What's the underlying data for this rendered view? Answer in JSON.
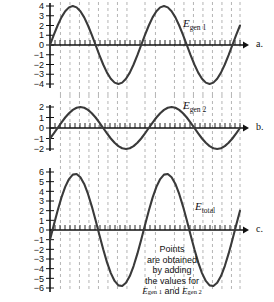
{
  "figure": {
    "part_labels": [
      "a.",
      "b.",
      "c."
    ],
    "caption_lines": [
      "Points",
      "are obtained",
      "by adding",
      "the values for"
    ],
    "caption_last_prefix": "E",
    "caption_last_sub1": "gen 1",
    "caption_last_mid": " and ",
    "caption_last_sub2": "gen 2",
    "colors": {
      "curve": "#3a3a3a",
      "axis": "#111111",
      "dashed": "#b4b4b4",
      "text": "#111111",
      "background": "#ffffff"
    }
  },
  "chart_data": [
    {
      "id": "egen1",
      "type": "line",
      "title": "",
      "label": "E_gen 1",
      "label_main": "E",
      "label_sub": "gen 1",
      "part": "a.",
      "xlabel": "",
      "ylabel": "",
      "ylim": [
        -4,
        4
      ],
      "yticks": [
        4,
        3,
        2,
        1,
        0,
        -1,
        -2,
        -3,
        -4
      ],
      "ytick_labels": [
        "4",
        "3",
        "2",
        "1",
        "0",
        "−1",
        "−2",
        "−3",
        "−4"
      ],
      "grid": false,
      "amplitude": 4,
      "periods": 2,
      "phase_deg": 0,
      "waveform": "sine",
      "x": [
        0,
        15,
        30,
        45,
        60,
        75,
        90,
        105,
        120,
        135,
        150,
        165,
        180,
        195,
        210,
        225,
        240,
        255,
        270,
        285,
        300,
        315,
        330,
        345,
        360,
        375,
        390,
        405,
        420,
        435,
        450,
        465,
        480,
        495,
        510,
        525,
        540,
        555,
        570,
        585,
        600,
        615,
        630,
        645,
        660,
        675,
        690,
        705,
        720,
        735,
        750
      ],
      "values": [
        0,
        1.04,
        2,
        2.83,
        3.46,
        3.86,
        4,
        3.86,
        3.46,
        2.83,
        2,
        1.04,
        0,
        -1.04,
        -2,
        -2.83,
        -3.46,
        -3.86,
        -4,
        -3.86,
        -3.46,
        -2.83,
        -2,
        -1.04,
        0,
        1.04,
        2,
        2.83,
        3.46,
        3.86,
        4,
        3.86,
        3.46,
        2.83,
        2,
        1.04,
        0,
        -1.04,
        -2,
        -2.83,
        -3.46,
        -3.86,
        -4,
        -3.86,
        -3.46,
        -2.83,
        -2,
        -1.04,
        0,
        1.04,
        2
      ]
    },
    {
      "id": "egen2",
      "type": "line",
      "title": "",
      "label": "E_gen 2",
      "label_main": "E",
      "label_sub": "gen 2",
      "part": "b.",
      "xlabel": "",
      "ylabel": "",
      "ylim": [
        -2,
        2
      ],
      "yticks": [
        2,
        1,
        0,
        -1,
        -2
      ],
      "ytick_labels": [
        "2",
        "1",
        "0",
        "−1",
        "−2"
      ],
      "grid": false,
      "amplitude": 2,
      "periods": 2,
      "phase_deg": -30,
      "waveform": "sine",
      "x": [
        0,
        15,
        30,
        45,
        60,
        75,
        90,
        105,
        120,
        135,
        150,
        165,
        180,
        195,
        210,
        225,
        240,
        255,
        270,
        285,
        300,
        315,
        330,
        345,
        360,
        375,
        390,
        405,
        420,
        435,
        450,
        465,
        480,
        495,
        510,
        525,
        540,
        555,
        570,
        585,
        600,
        615,
        630,
        645,
        660,
        675,
        690,
        705,
        720,
        735,
        750
      ],
      "values": [
        -1.0,
        -0.52,
        0,
        0.52,
        1.0,
        1.41,
        1.73,
        1.93,
        2.0,
        1.93,
        1.73,
        1.41,
        1.0,
        0.52,
        0,
        -0.52,
        -1.0,
        -1.41,
        -1.73,
        -1.93,
        -2.0,
        -1.93,
        -1.73,
        -1.41,
        -1.0,
        -0.52,
        0,
        0.52,
        1.0,
        1.41,
        1.73,
        1.93,
        2.0,
        1.93,
        1.73,
        1.41,
        1.0,
        0.52,
        0,
        -0.52,
        -1.0,
        -1.41,
        -1.73,
        -1.93,
        -2.0,
        -1.93,
        -1.73,
        -1.41,
        -1.0,
        -0.52,
        0
      ]
    },
    {
      "id": "etotal",
      "type": "line",
      "title": "",
      "label": "E_total",
      "label_main": "E",
      "label_sub": "total",
      "part": "c.",
      "xlabel": "",
      "ylabel": "",
      "ylim": [
        -6,
        6
      ],
      "yticks": [
        6,
        5,
        4,
        3,
        2,
        1,
        0,
        -1,
        -2,
        -3,
        -4,
        -5,
        -6
      ],
      "ytick_labels": [
        "6",
        "5",
        "4",
        "3",
        "2",
        "1",
        "0",
        "−1",
        "−2",
        "−3",
        "−4",
        "−5",
        "−6"
      ],
      "grid": false,
      "amplitude": 5.8,
      "periods": 2,
      "phase_deg": -10,
      "waveform": "sine-sum",
      "x": [
        0,
        15,
        30,
        45,
        60,
        75,
        90,
        105,
        120,
        135,
        150,
        165,
        180,
        195,
        210,
        225,
        240,
        255,
        270,
        285,
        300,
        315,
        330,
        345,
        360,
        375,
        390,
        405,
        420,
        435,
        450,
        465,
        480,
        495,
        510,
        525,
        540,
        555,
        570,
        585,
        600,
        615,
        630,
        645,
        660,
        675,
        690,
        705,
        720,
        735,
        750
      ],
      "values": [
        -1.0,
        0.52,
        2.0,
        3.35,
        4.46,
        5.27,
        5.73,
        5.79,
        5.46,
        4.76,
        3.73,
        2.45,
        1.0,
        -0.52,
        -2.0,
        -3.35,
        -4.46,
        -5.27,
        -5.73,
        -5.79,
        -5.46,
        -4.76,
        -3.73,
        -2.45,
        -1.0,
        0.52,
        2.0,
        3.35,
        4.46,
        5.27,
        5.73,
        5.79,
        5.46,
        4.76,
        3.73,
        2.45,
        1.0,
        -0.52,
        -2.0,
        -3.35,
        -4.46,
        -5.27,
        -5.73,
        -5.79,
        -5.46,
        -4.76,
        -3.73,
        -2.45,
        -1.0,
        0.52,
        2.0
      ]
    }
  ]
}
